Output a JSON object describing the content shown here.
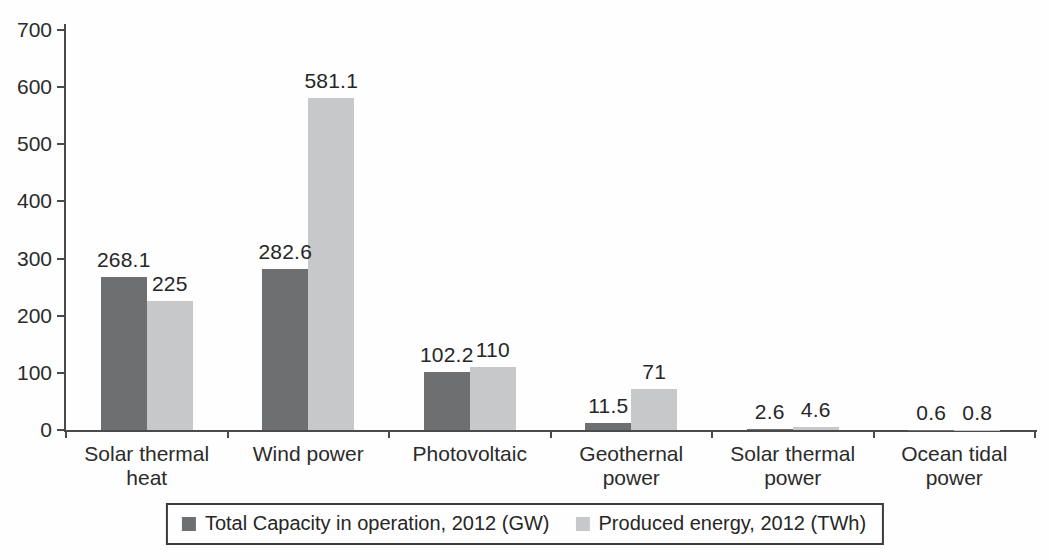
{
  "chart_data": {
    "type": "bar",
    "title": "",
    "xlabel": "",
    "ylabel": "",
    "categories": [
      "Solar thermal heat",
      "Wind power",
      "Photovoltaic",
      "Geothernal power",
      "Solar thermal power",
      "Ocean tidal power"
    ],
    "series": [
      {
        "name": "Total Capacity in operation, 2012 (GW)",
        "color": "#6e6f71",
        "values": [
          268.1,
          282.6,
          102.2,
          11.5,
          2.6,
          0.6
        ]
      },
      {
        "name": "Produced energy, 2012 (TWh)",
        "color": "#c7c8c9",
        "values": [
          225,
          581.1,
          110,
          71,
          4.6,
          0.8
        ]
      }
    ],
    "ylim": [
      0,
      700
    ],
    "yticks": [
      0,
      100,
      200,
      300,
      400,
      500,
      600,
      700
    ],
    "grid": "off",
    "legend_position": "bottom-boxed",
    "value_labels": "on",
    "axis_color": "#4a4a4c",
    "text_color": "#2b2b2b"
  }
}
